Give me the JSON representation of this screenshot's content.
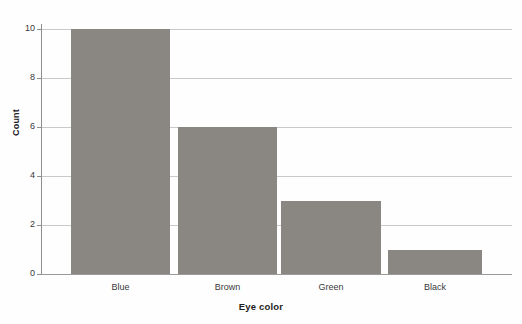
{
  "chart_data": {
    "type": "bar",
    "title": "",
    "subtitle": "",
    "xlabel": "Eye color",
    "ylabel": "Count",
    "categories": [
      "Blue",
      "Brown",
      "Green",
      "Black"
    ],
    "values": [
      10,
      6,
      3,
      1
    ],
    "series": [
      {
        "name": "Count",
        "values": [
          10,
          6,
          3,
          1
        ]
      }
    ],
    "ylim": [
      0,
      10
    ],
    "yticks": [
      0,
      2,
      4,
      6,
      8,
      10
    ],
    "ytick_labels": [
      "0",
      "2",
      "4",
      "6",
      "8",
      "10"
    ],
    "grid": "horizontal",
    "legend": "none",
    "bar_color": "#8a8783",
    "gridline_color": "#c9c9c9",
    "axis_color": "#8e8e8e",
    "background_color": "#fefefe",
    "text_color": "#39383a"
  }
}
